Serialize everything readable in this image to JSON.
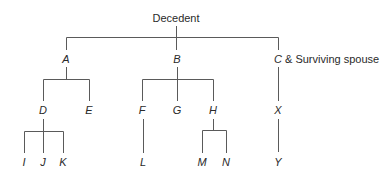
{
  "diagram": {
    "type": "family-tree",
    "line_color": "#5a5a5a",
    "root": "Decedent",
    "nodes": {
      "decedent": "Decedent",
      "a": "A",
      "b": "B",
      "c_letter": "C",
      "c_suffix": " & Surviving spouse",
      "d": "D",
      "e": "E",
      "f": "F",
      "g": "G",
      "h": "H",
      "x": "X",
      "i": "I",
      "j": "J",
      "k": "K",
      "l": "L",
      "m": "M",
      "n": "N",
      "y": "Y"
    },
    "edges": [
      [
        "Decedent",
        "A"
      ],
      [
        "Decedent",
        "B"
      ],
      [
        "Decedent",
        "C & Surviving spouse"
      ],
      [
        "A",
        "D"
      ],
      [
        "A",
        "E"
      ],
      [
        "B",
        "F"
      ],
      [
        "B",
        "G"
      ],
      [
        "B",
        "H"
      ],
      [
        "C & Surviving spouse",
        "X"
      ],
      [
        "D",
        "I"
      ],
      [
        "D",
        "J"
      ],
      [
        "D",
        "K"
      ],
      [
        "F",
        "L"
      ],
      [
        "H",
        "M"
      ],
      [
        "H",
        "N"
      ],
      [
        "X",
        "Y"
      ]
    ]
  }
}
